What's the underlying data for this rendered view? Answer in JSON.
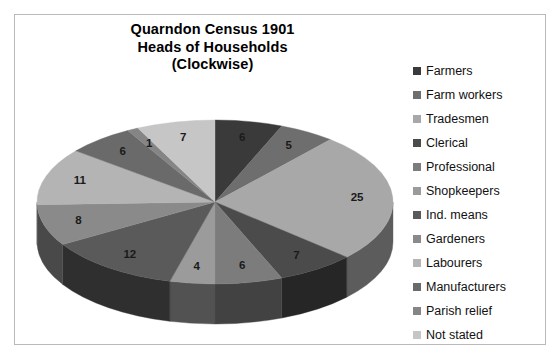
{
  "chart_data": {
    "type": "pie",
    "title": "Quarndon Census 1901\nHeads of Households\n(Clockwise)",
    "title_lines": [
      "Quarndon Census 1901",
      "Heads of Households",
      "(Clockwise)"
    ],
    "direction": "clockwise",
    "start_angle_deg": 0,
    "total": 98,
    "legend_position": "right",
    "three_d": true,
    "categories": [
      "Farmers",
      "Farm workers",
      "Tradesmen",
      "Clerical",
      "Professional",
      "Shopkeepers",
      "Ind. means",
      "Gardeners",
      "Labourers",
      "Manufacturers",
      "Parish relief",
      "Not stated"
    ],
    "values": [
      6,
      5,
      25,
      7,
      6,
      4,
      12,
      8,
      11,
      6,
      1,
      7
    ],
    "data_labels": [
      "6",
      "5",
      "25",
      "7",
      "6",
      "4",
      "12",
      "8",
      "11",
      "6",
      "1",
      "7"
    ],
    "colors": [
      "#3a3a3a",
      "#6e6e6e",
      "#a8a8a8",
      "#4b4b4b",
      "#7c7c7c",
      "#9b9b9b",
      "#5a5a5a",
      "#8a8a8a",
      "#b4b4b4",
      "#6a6a6a",
      "#858585",
      "#c6c6c6"
    ],
    "side_colors": [
      "#1d1d1d",
      "#3a3a3a",
      "#5c5c5c",
      "#262626",
      "#424242",
      "#525252",
      "#2f2f2f",
      "#494949",
      "#626262",
      "#383838",
      "#464646",
      "#6d6d6d"
    ],
    "xlabel": "",
    "ylabel": "",
    "grid": false
  },
  "legend": {
    "items": [
      {
        "label": "Farmers",
        "color": "#3a3a3a",
        "value": 6
      },
      {
        "label": "Farm workers",
        "color": "#6e6e6e",
        "value": 5
      },
      {
        "label": "Tradesmen",
        "color": "#a8a8a8",
        "value": 25
      },
      {
        "label": "Clerical",
        "color": "#4b4b4b",
        "value": 7
      },
      {
        "label": "Professional",
        "color": "#7c7c7c",
        "value": 6
      },
      {
        "label": "Shopkeepers",
        "color": "#9b9b9b",
        "value": 4
      },
      {
        "label": "Ind. means",
        "color": "#5a5a5a",
        "value": 12
      },
      {
        "label": "Gardeners",
        "color": "#8a8a8a",
        "value": 8
      },
      {
        "label": "Labourers",
        "color": "#b4b4b4",
        "value": 11
      },
      {
        "label": "Manufacturers",
        "color": "#6a6a6a",
        "value": 6
      },
      {
        "label": "Parish relief",
        "color": "#858585",
        "value": 1
      },
      {
        "label": "Not stated",
        "color": "#c6c6c6",
        "value": 7
      }
    ]
  }
}
